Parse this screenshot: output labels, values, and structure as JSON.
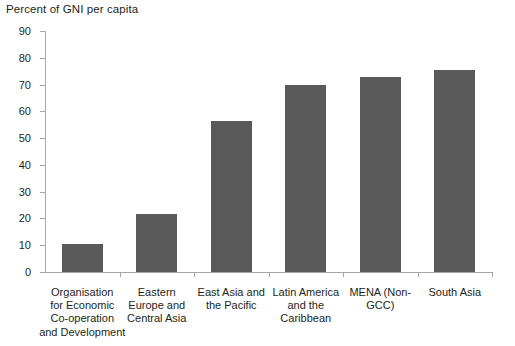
{
  "chart_data": {
    "type": "bar",
    "title": "Percent of GNI per capita",
    "xlabel": "",
    "ylabel": "",
    "ylim": [
      0,
      90
    ],
    "yticks": [
      0,
      10,
      20,
      30,
      40,
      50,
      60,
      70,
      80,
      90
    ],
    "grid": false,
    "legend": null,
    "bar_color": "#595959",
    "axis_color": "#a6a6a6",
    "categories": [
      "Organisation for Economic Co-operation and Development",
      "Eastern Europe and Central Asia",
      "East Asia and the Pacific",
      "Latin America and the Caribbean",
      "MENA (Non-GCC)",
      "South Asia"
    ],
    "category_lines": [
      [
        "Organisation",
        "for Economic",
        "Co-operation",
        "and Development"
      ],
      [
        "Eastern",
        "Europe and",
        "Central Asia"
      ],
      [
        "East Asia and",
        "the Pacific"
      ],
      [
        "Latin America",
        "and the",
        "Caribbean"
      ],
      [
        "MENA (Non-",
        "GCC)"
      ],
      [
        "South Asia"
      ]
    ],
    "values": [
      10.5,
      21.8,
      56.5,
      70.0,
      73.0,
      75.5
    ]
  }
}
